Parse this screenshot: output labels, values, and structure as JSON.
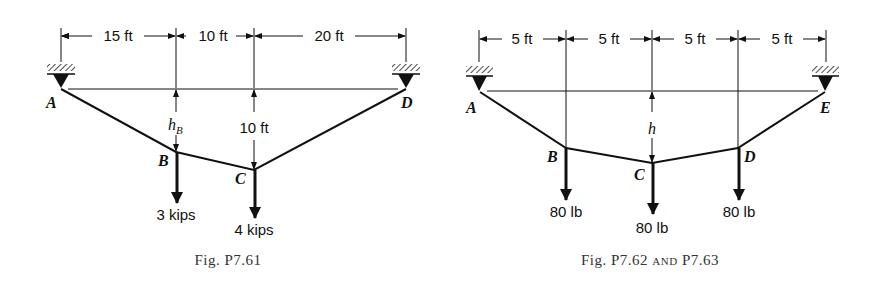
{
  "figures": [
    {
      "caption": "Fig. P7.61",
      "dimensions": [
        "15 ft",
        "10 ft",
        "20 ft"
      ],
      "points": {
        "A": "A",
        "B": "B",
        "C": "C",
        "D": "D"
      },
      "sag_labels": {
        "B": "h",
        "B_sub": "B",
        "C": "10 ft"
      },
      "loads": {
        "B": "3 kips",
        "C": "4 kips"
      }
    },
    {
      "caption": "Fig. P7.62 and P7.63",
      "caption_main": "Fig. P7.62 ",
      "caption_and": "and",
      "caption_end": " P7.63",
      "dimensions": [
        "5 ft",
        "5 ft",
        "5 ft",
        "5 ft"
      ],
      "points": {
        "A": "A",
        "B": "B",
        "C": "C",
        "D": "D",
        "E": "E"
      },
      "sag_labels": {
        "C": "h"
      },
      "loads": {
        "B": "80 lb",
        "C": "80 lb",
        "D": "80 lb"
      }
    }
  ]
}
